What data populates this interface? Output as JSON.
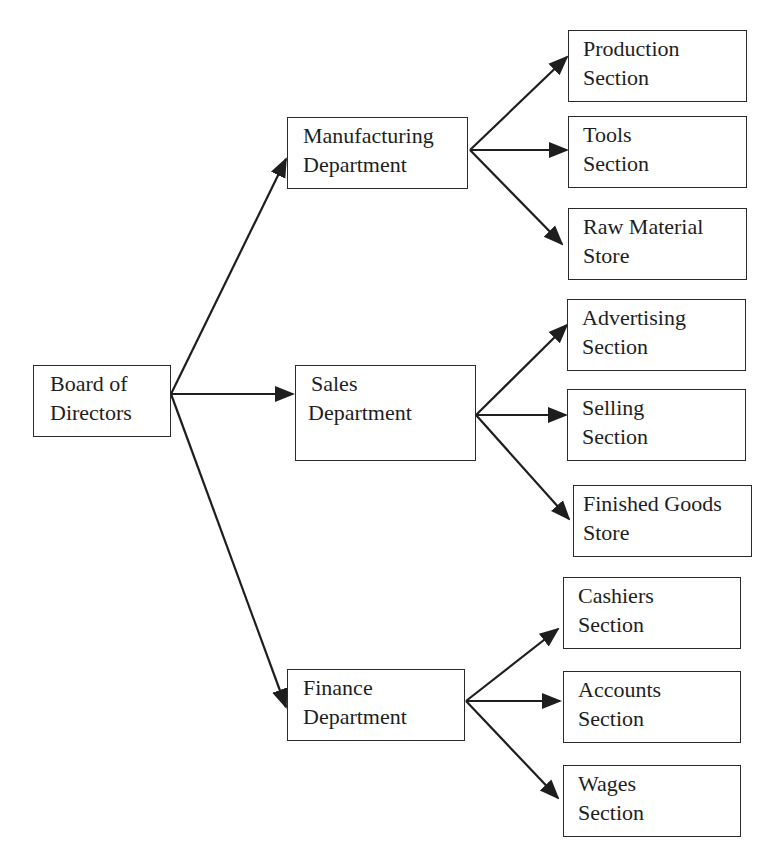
{
  "diagram": {
    "type": "organization-chart",
    "colors": {
      "line": "#1e1e1e",
      "box_border": "#2a2a2a",
      "text": "#1e1e1e",
      "background": "#ffffff"
    },
    "root": {
      "id": "board",
      "lines": [
        "Board of",
        "Directors"
      ]
    },
    "departments": [
      {
        "id": "manufacturing",
        "lines": [
          "Manufacturing",
          "Department"
        ],
        "sections": [
          {
            "id": "production",
            "lines": [
              "Production",
              "Section"
            ]
          },
          {
            "id": "tools",
            "lines": [
              "Tools",
              "Section"
            ]
          },
          {
            "id": "raw-material",
            "lines": [
              "Raw Material",
              "Store"
            ]
          }
        ]
      },
      {
        "id": "sales",
        "lines": [
          "Sales",
          "Department"
        ],
        "sections": [
          {
            "id": "advertising",
            "lines": [
              "Advertising",
              "Section"
            ]
          },
          {
            "id": "selling",
            "lines": [
              "Selling",
              "Section"
            ]
          },
          {
            "id": "finished-goods",
            "lines": [
              "Finished Goods",
              "Store"
            ]
          }
        ]
      },
      {
        "id": "finance",
        "lines": [
          "Finance",
          "Department"
        ],
        "sections": [
          {
            "id": "cashiers",
            "lines": [
              "Cashiers",
              "Section"
            ]
          },
          {
            "id": "accounts",
            "lines": [
              "Accounts",
              "Section"
            ]
          },
          {
            "id": "wages",
            "lines": [
              "Wages",
              "Section"
            ]
          }
        ]
      }
    ],
    "edges": [
      [
        "board",
        "manufacturing"
      ],
      [
        "board",
        "sales"
      ],
      [
        "board",
        "finance"
      ],
      [
        "manufacturing",
        "production"
      ],
      [
        "manufacturing",
        "tools"
      ],
      [
        "manufacturing",
        "raw-material"
      ],
      [
        "sales",
        "advertising"
      ],
      [
        "sales",
        "selling"
      ],
      [
        "sales",
        "finished-goods"
      ],
      [
        "finance",
        "cashiers"
      ],
      [
        "finance",
        "accounts"
      ],
      [
        "finance",
        "wages"
      ]
    ]
  }
}
